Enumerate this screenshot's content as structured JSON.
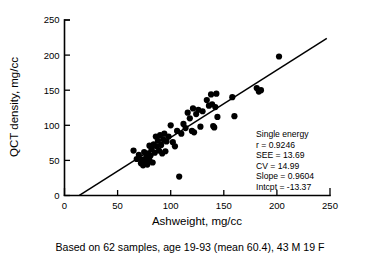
{
  "chart_data": {
    "type": "scatter",
    "title": "",
    "xlabel": "Ashweight, mg/cc",
    "ylabel": "QCT density, mg/cc",
    "xlim": [
      0,
      250
    ],
    "ylim": [
      0,
      250
    ],
    "xticks": [
      0,
      50,
      100,
      150,
      200,
      250
    ],
    "yticks": [
      0,
      50,
      100,
      150,
      200,
      250
    ],
    "xtick_labels": [
      "0",
      "50",
      "100",
      "150",
      "200",
      "250"
    ],
    "ytick_labels": [
      "0",
      "50",
      "100",
      "150",
      "200",
      "250"
    ],
    "grid": false,
    "legend": "none",
    "series": [
      {
        "name": "Single energy samples",
        "marker": "filled-circle",
        "color": "#000000",
        "points": [
          [
            65,
            64
          ],
          [
            68,
            52
          ],
          [
            70,
            58
          ],
          [
            72,
            46
          ],
          [
            73,
            51
          ],
          [
            74,
            43
          ],
          [
            75,
            62
          ],
          [
            76,
            48
          ],
          [
            77,
            55
          ],
          [
            78,
            44
          ],
          [
            79,
            60
          ],
          [
            80,
            50
          ],
          [
            80,
            71
          ],
          [
            81,
            57
          ],
          [
            82,
            66
          ],
          [
            83,
            47
          ],
          [
            84,
            73
          ],
          [
            85,
            61
          ],
          [
            86,
            84
          ],
          [
            87,
            70
          ],
          [
            88,
            78
          ],
          [
            89,
            64
          ],
          [
            90,
            86
          ],
          [
            91,
            72
          ],
          [
            92,
            60
          ],
          [
            93,
            80
          ],
          [
            94,
            88
          ],
          [
            95,
            63
          ],
          [
            96,
            77
          ],
          [
            98,
            84
          ],
          [
            100,
            100
          ],
          [
            102,
            76
          ],
          [
            104,
            70
          ],
          [
            106,
            92
          ],
          [
            108,
            27
          ],
          [
            110,
            88
          ],
          [
            112,
            102
          ],
          [
            114,
            96
          ],
          [
            116,
            118
          ],
          [
            118,
            110
          ],
          [
            120,
            92
          ],
          [
            121,
            124
          ],
          [
            122,
            90
          ],
          [
            124,
            116
          ],
          [
            126,
            122
          ],
          [
            128,
            98
          ],
          [
            130,
            120
          ],
          [
            134,
            136
          ],
          [
            136,
            128
          ],
          [
            138,
            144
          ],
          [
            139,
            130
          ],
          [
            140,
            99
          ],
          [
            141,
            97
          ],
          [
            142,
            126
          ],
          [
            143,
            145
          ],
          [
            144,
            112
          ],
          [
            158,
            140
          ],
          [
            160,
            113
          ],
          [
            181,
            153
          ],
          [
            183,
            148
          ],
          [
            185,
            150
          ],
          [
            202,
            198
          ]
        ]
      }
    ],
    "fit_line": {
      "name": "regression-line",
      "slope": 0.9604,
      "intercept": -13.37,
      "x_start": 14,
      "x_end": 247,
      "color": "#000000"
    },
    "annotations": {
      "title": "Single energy",
      "lines": [
        "r = 0.9246",
        "SEE = 13.69",
        "CV = 14.99",
        "Slope = 0.9604",
        "Intcpt = -13.37"
      ]
    },
    "caption": "Based on 62 samples, age 19-93 (mean 60.4), 43 M 19 F"
  }
}
